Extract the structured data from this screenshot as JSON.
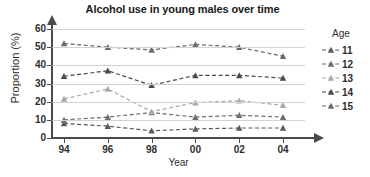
{
  "chart_data": {
    "type": "line",
    "title": "Alcohol use in young males over time",
    "xlabel": "Year",
    "ylabel": "Proportion (%)",
    "categories": [
      "94",
      "96",
      "98",
      "00",
      "02",
      "04"
    ],
    "ylim": [
      0,
      60
    ],
    "yticks": [
      0,
      10,
      20,
      30,
      40,
      50,
      60
    ],
    "grid": true,
    "legend_position": "right",
    "legend_title": "Age",
    "line_style": "dashed",
    "marker": "triangle",
    "series": [
      {
        "name": "11",
        "color": "#5a5a5a",
        "values": [
          8,
          6.5,
          4,
          5,
          5.5,
          5.5
        ]
      },
      {
        "name": "12",
        "color": "#6e6e6e",
        "values": [
          10,
          11.5,
          14,
          11.5,
          12.5,
          11.5
        ]
      },
      {
        "name": "13",
        "color": "#a8a8a8",
        "values": [
          21.5,
          27,
          14.5,
          19.5,
          20.5,
          18
        ]
      },
      {
        "name": "14",
        "color": "#4a4a4a",
        "values": [
          34,
          37,
          29,
          34.5,
          34.5,
          33
        ]
      },
      {
        "name": "15",
        "color": "#6a6a6a",
        "values": [
          52,
          50,
          48.5,
          51.5,
          50,
          45
        ]
      }
    ]
  }
}
